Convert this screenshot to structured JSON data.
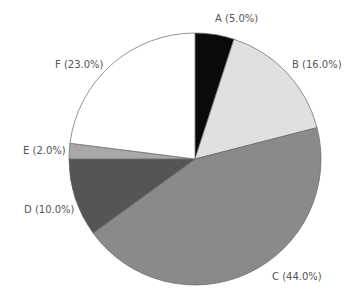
{
  "chart_data": {
    "type": "pie",
    "title": "",
    "start_angle": "12 o'clock",
    "direction": "clockwise",
    "categories": [
      "A",
      "B",
      "C",
      "D",
      "E",
      "F"
    ],
    "values": [
      5.0,
      16.0,
      44.0,
      10.0,
      2.0,
      23.0
    ],
    "colors": [
      "#0a0a0a",
      "#e0e0e0",
      "#8a8a8a",
      "#555555",
      "#a8a8a8",
      "#ffffff"
    ],
    "legend": "none",
    "labels": [
      {
        "text": "A (5.0%)",
        "x": 215,
        "y": 13
      },
      {
        "text": "B (16.0%)",
        "x": 292,
        "y": 59
      },
      {
        "text": "C (44.0%)",
        "x": 272,
        "y": 271
      },
      {
        "text": "D (10.0%)",
        "x": 24,
        "y": 204
      },
      {
        "text": "E (2.0%)",
        "x": 23,
        "y": 145
      },
      {
        "text": "F (23.0%)",
        "x": 55,
        "y": 59
      }
    ]
  },
  "geometry": {
    "cx": 195,
    "cy": 159,
    "r": 126
  }
}
